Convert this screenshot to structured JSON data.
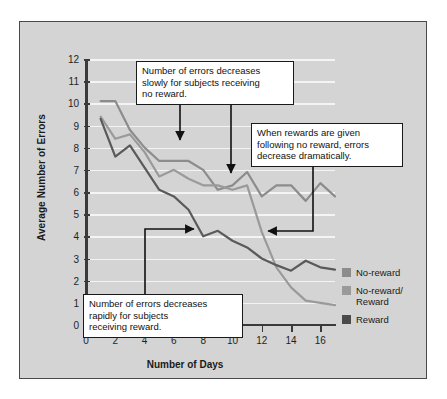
{
  "chart_data": {
    "type": "line",
    "title": "",
    "xlabel": "Number of Days",
    "ylabel": "Average Number of Errors",
    "xlim": [
      0,
      17
    ],
    "ylim": [
      0,
      12
    ],
    "xticks": [
      0,
      2,
      4,
      6,
      8,
      10,
      12,
      14,
      16
    ],
    "yticks": [
      0,
      1,
      2,
      3,
      4,
      5,
      6,
      7,
      8,
      9,
      10,
      11,
      12
    ],
    "grid": "horizontal",
    "legend_position": "right",
    "x": [
      1,
      2,
      3,
      4,
      5,
      6,
      7,
      8,
      9,
      10,
      11,
      12,
      13,
      14,
      15,
      16,
      17
    ],
    "series": [
      {
        "name": "No-reward",
        "color": "#8c8c8c",
        "values": [
          10.1,
          10.1,
          8.8,
          8.0,
          7.4,
          7.4,
          7.4,
          7.0,
          6.1,
          6.3,
          6.9,
          5.8,
          6.3,
          6.3,
          5.6,
          6.4,
          5.8
        ]
      },
      {
        "name": "No-reward/Reward",
        "color": "#9a9a9a",
        "values": [
          9.4,
          8.4,
          8.6,
          7.8,
          6.7,
          7.0,
          6.6,
          6.3,
          6.3,
          6.1,
          6.3,
          4.2,
          2.6,
          1.7,
          1.1,
          1.0,
          0.9
        ]
      },
      {
        "name": "Reward",
        "color": "#5a5a5a",
        "values": [
          9.3,
          7.6,
          8.1,
          7.1,
          6.1,
          5.8,
          5.2,
          4.0,
          4.25,
          3.8,
          3.5,
          3.0,
          2.7,
          2.45,
          2.9,
          2.6,
          2.5
        ]
      }
    ],
    "annotations": [
      {
        "id": "note-top",
        "text": "Number of errors decreases slowly for subjects receiving no reward.",
        "lines": [
          "Number of errors decreases",
          "slowly for subjects receiving",
          "no reward."
        ],
        "arrow_targets": [
          [
            7,
            7.4
          ],
          [
            9,
            6.3
          ]
        ]
      },
      {
        "id": "note-right",
        "text": "When rewards are given following no reward, errors decrease dramatically.",
        "lines": [
          "When rewards are given",
          "following no reward, errors",
          "decrease dramatically."
        ],
        "arrow_targets": [
          [
            12,
            4.4
          ]
        ]
      },
      {
        "id": "note-bottom",
        "text": "Number of errors decreases rapidly for subjects receiving reward.",
        "lines": [
          "Number of errors decreases",
          "rapidly for subjects",
          "receiving reward."
        ],
        "arrow_targets": [
          [
            8,
            4.7
          ]
        ]
      }
    ]
  },
  "legend": {
    "items": [
      {
        "label": "No-reward",
        "label2": "",
        "color": "#8c8c8c"
      },
      {
        "label": "No-reward/",
        "label2": "Reward",
        "color": "#9a9a9a"
      },
      {
        "label": "Reward",
        "label2": "",
        "color": "#4a4a4a"
      }
    ]
  },
  "axes": {
    "x_title": "Number of Days",
    "y_title": "Average Number of Errors"
  },
  "colors": {
    "figure_background": "#d4d4d4",
    "page_background": "#ffffff",
    "gridline": "#f4f4f4",
    "axis": "#3a3a3a",
    "annotation_border": "#1a1a1a",
    "annotation_background": "#ffffff"
  }
}
